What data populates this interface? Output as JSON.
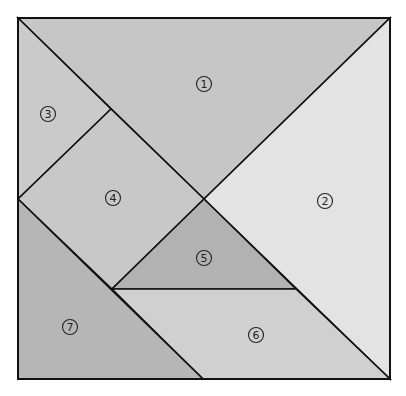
{
  "diagram": {
    "frame": {
      "x": 18,
      "y": 18,
      "width": 372,
      "height": 361
    },
    "pieces": [
      {
        "id": "1",
        "label": "1",
        "shape": "large-triangle",
        "points": "18,18 390,18 204,199",
        "fill": "#c6c6c6",
        "label_pos": [
          204,
          84
        ]
      },
      {
        "id": "2",
        "label": "2",
        "shape": "large-triangle",
        "points": "390,18 390,379 204,199",
        "fill": "#e3e3e3",
        "label_pos": [
          325,
          201
        ]
      },
      {
        "id": "3",
        "label": "3",
        "shape": "small-triangle",
        "points": "18,18 111,109 18,199",
        "fill": "#cacaca",
        "label_pos": [
          48,
          114
        ]
      },
      {
        "id": "4",
        "label": "4",
        "shape": "square",
        "points": "111,109 204,199 112,289 18,199",
        "fill": "#c8c8c8",
        "label_pos": [
          113,
          198
        ]
      },
      {
        "id": "5",
        "label": "5",
        "shape": "small-triangle",
        "points": "204,199 296,289 112,289",
        "fill": "#b2b2b2",
        "label_pos": [
          204,
          258
        ]
      },
      {
        "id": "6",
        "label": "6",
        "shape": "parallelogram",
        "points": "112,289 296,289 390,379 203,379",
        "fill": "#d0d0d0",
        "label_pos": [
          256,
          335
        ]
      },
      {
        "id": "7",
        "label": "7",
        "shape": "medium-triangle",
        "points": "18,199 203,379 18,379",
        "fill": "#b6b6b6",
        "label_pos": [
          70,
          327
        ]
      }
    ],
    "label_glyphs": [
      "①",
      "②",
      "③",
      "④",
      "⑤",
      "⑥",
      "⑦"
    ]
  }
}
